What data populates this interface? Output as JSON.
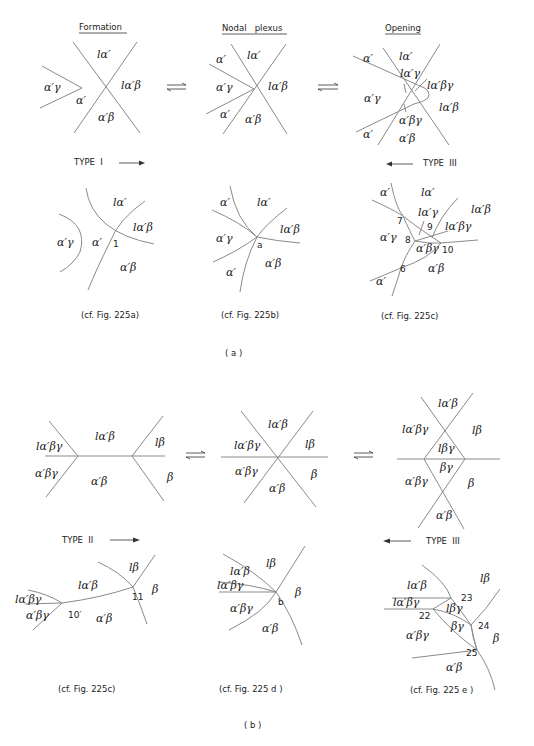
{
  "part_a": {
    "label": "( a )",
    "headers": [
      "Formation",
      "Nodal   plexus",
      "Opening"
    ],
    "type_left": "TYPE  I",
    "type_right": "TYPE  III",
    "top": {
      "formation": [
        "lα′",
        "α′γ",
        "α′",
        "lα′β",
        "α′β"
      ],
      "nodal": [
        "α′",
        "lα′",
        "α′γ",
        "lα′β",
        "α′",
        "α′β"
      ],
      "opening": [
        "α′",
        "lα′",
        "lα′γ",
        "lα′βγ",
        "α′γ",
        "lα′β",
        "α′βγ",
        "α′",
        "α′β"
      ]
    },
    "bottom": {
      "formation": {
        "labels": [
          "lα′",
          "lα′β",
          "α′γ",
          "α′",
          "α′β"
        ],
        "points": [
          "1"
        ]
      },
      "nodal": {
        "labels": [
          "α′",
          "lα′",
          "lα′β",
          "α′γ",
          "α′",
          "α′β"
        ],
        "points": [
          "a"
        ]
      },
      "opening": {
        "labels": [
          "α′",
          "lα′",
          "lα′γ",
          "lα′β",
          "lα′βγ",
          "α′γ",
          "α′βγ",
          "α′β",
          "α′"
        ],
        "points": [
          "7",
          "9",
          "8",
          "10",
          "6"
        ]
      }
    },
    "captions": [
      "(cf. Fig. 225a)",
      "(cf. Fig. 225b)",
      "(cf. Fig. 225c)"
    ]
  },
  "part_b": {
    "label": "( b )",
    "type_left": "TYPE  II",
    "type_right": "TYPE  III",
    "top": {
      "formation": [
        "lα′βγ",
        "lα′β",
        "lβ",
        "α′βγ",
        "α′β",
        "β"
      ],
      "nodal": [
        "lα′β",
        "lα′βγ",
        "lβ",
        "α′βγ",
        "β",
        "α′β"
      ],
      "opening": [
        "lα′β",
        "lα′βγ",
        "lβ",
        "lβγ",
        "βγ",
        "α′βγ",
        "β",
        "α′β"
      ]
    },
    "bottom": {
      "formation": {
        "labels": [
          "lβ",
          "lα′β",
          "β",
          "lα′βγ",
          "α′βγ",
          "α′β"
        ],
        "points": [
          "11",
          "10′"
        ]
      },
      "nodal": {
        "labels": [
          "lβ",
          "lα′β",
          "lα′βγ",
          "β",
          "α′βγ",
          "α′β"
        ],
        "points": [
          "b"
        ]
      },
      "opening": {
        "labels": [
          "lβ",
          "lα′β",
          "lα′βγ",
          "lβγ",
          "βγ",
          "α′βγ",
          "β",
          "α′β"
        ],
        "points": [
          "23",
          "22",
          "24",
          "25"
        ]
      }
    },
    "captions": [
      "(cf. Fig. 225c)",
      "(cf. Fig. 225 d )",
      "(cf. Fig. 225 e )"
    ]
  }
}
